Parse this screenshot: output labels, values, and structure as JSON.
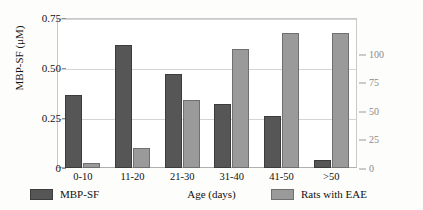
{
  "chart_data": {
    "type": "bar",
    "title": "",
    "xlabel": "Age (days)",
    "categories": [
      "0-10",
      "11-20",
      "21-30",
      "31-40",
      "41-50",
      ">50"
    ],
    "series": [
      {
        "name": "MBP-SF",
        "axis": "left",
        "color": "#565656",
        "values": [
          0.37,
          0.62,
          0.475,
          0.32,
          0.26,
          0.04
        ]
      },
      {
        "name": "Rats with EAE",
        "axis": "right",
        "color": "#9a9a9a",
        "values": [
          4,
          15,
          50,
          88,
          100,
          100
        ]
      }
    ],
    "left_axis": {
      "label": "MBP-SF (μM)",
      "ticks": [
        "0",
        "0.25",
        "0.50",
        "0.75"
      ],
      "tick_values": [
        0,
        0.25,
        0.5,
        0.75
      ],
      "ylim": [
        0,
        0.75
      ],
      "color": "#111111"
    },
    "right_axis": {
      "label": "Rats with EAE (%)",
      "ticks": [
        "0",
        "25",
        "50",
        "75",
        "100"
      ],
      "tick_values": [
        0,
        25,
        50,
        75,
        100
      ],
      "ylim": [
        0,
        110
      ],
      "color": "#8a8a8a"
    },
    "grid": "horizontal",
    "legend_position": "bottom",
    "legend": [
      {
        "label": "MBP-SF",
        "color": "#565656"
      },
      {
        "label": "Rats with EAE",
        "color": "#9a9a9a"
      }
    ]
  }
}
